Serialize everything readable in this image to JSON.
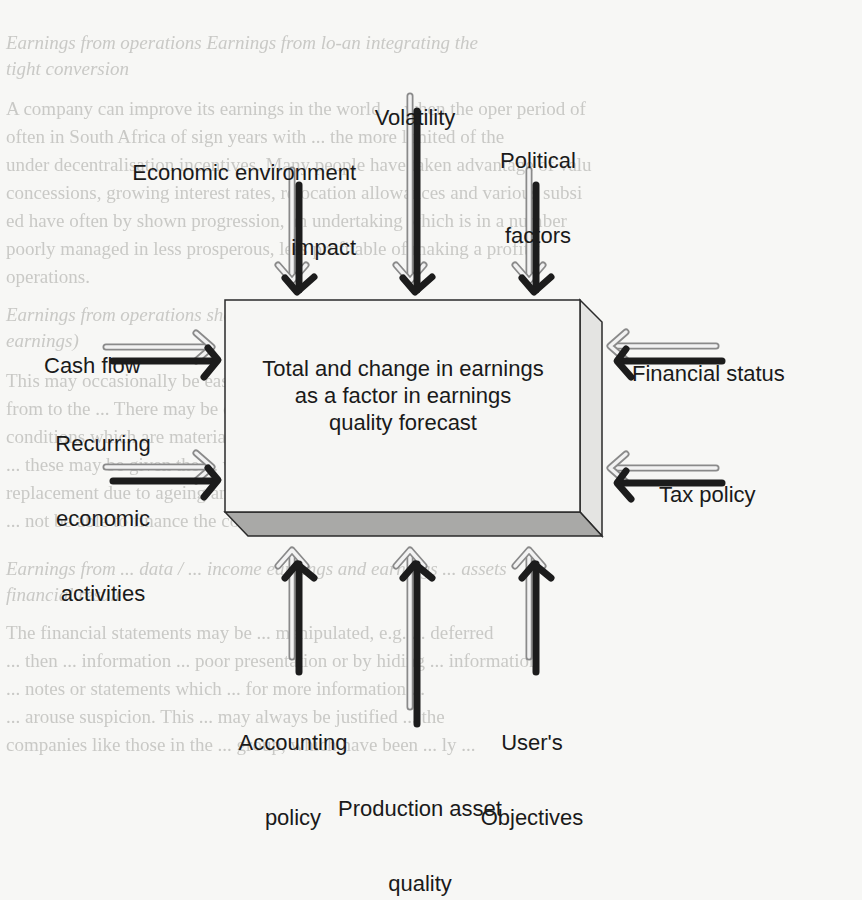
{
  "diagram": {
    "center_box": {
      "lines": [
        "Total and change in earnings",
        "as a factor in earnings",
        "quality forecast"
      ]
    },
    "top_factors": [
      {
        "label_lines": [
          "Economic environment",
          "impact"
        ],
        "direction": "down"
      },
      {
        "label_lines": [
          "Volatility"
        ],
        "direction": "down"
      },
      {
        "label_lines": [
          "Political",
          "factors"
        ],
        "direction": "down"
      }
    ],
    "left_factors": [
      {
        "label_lines": [
          "Cash flow"
        ],
        "direction": "right"
      },
      {
        "label_lines": [
          "Recurring",
          "economic",
          "activities"
        ],
        "direction": "right"
      }
    ],
    "right_factors": [
      {
        "label_lines": [
          "Financial status"
        ],
        "direction": "left"
      },
      {
        "label_lines": [
          "Tax policy"
        ],
        "direction": "left"
      }
    ],
    "bottom_factors": [
      {
        "label_lines": [
          "Accounting",
          "policy"
        ],
        "direction": "up"
      },
      {
        "label_lines": [
          "Production asset",
          "quality"
        ],
        "direction": "up"
      },
      {
        "label_lines": [
          "User's",
          "Objectives"
        ],
        "direction": "up"
      }
    ],
    "colors": {
      "arrow_dark": "#1c1c1c",
      "arrow_light_outline": "#8a8a8a",
      "arrow_light_fill": "#f2f2f2",
      "box_front": "#f6f6f4",
      "box_side": "#e4e4e2",
      "box_bottom": "#a9a9a7",
      "box_stroke": "#2a2a2a"
    }
  },
  "show_through_text": [
    "Earnings from operations                    Earnings from lo-an integrating the",
    "                                                              tight conversion",
    "A company can improve its earnings in the world ... when the oper period of",
    "often in South Africa of sign years with ... the more limited of the",
    "under decentralisation incentives. Many people have taken advantage of valu",
    "concessions, growing interest rates, relocation allowances and various subsi",
    "ed have often by shown progression, an undertaking which is in a number",
    "poorly managed in less prosperous, less profitable of making a profit f",
    "operations.",
    "Earnings from operations sheet    Earnings from ... income (other",
    "                                               earnings)",
    "This may occasionally be easy to identify the ... from which ... arise",
    "from to the ... There may be changes in liabilities ... cost allocation",
    "conditions which are materially affect the company in the time to look at",
    "... these may be given the ... which are ... involved",
    "replacement due to ageing and particularly in time of rising prices the compa",
    "... not be able to finance the cost of replacement.",
    "Earnings from ... data / ... income             earnings and earnings ... assets",
    "                                                     financial result",
    "The financial statements may be ... manipulated, e.g. ... deferred",
    "... then ... information ... poor presentation or by hiding ... information",
    "... notes or statements which ... for more information ...",
    "... arouse suspicion. This ... may always be justified ... the",
    "companies like those in the ... group, which have been ... ly ..."
  ]
}
